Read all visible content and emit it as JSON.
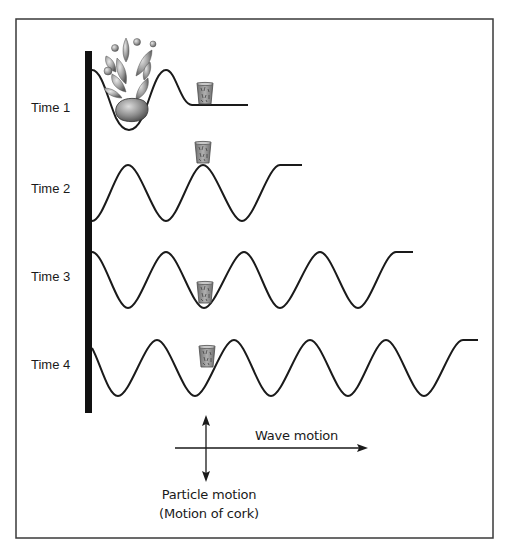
{
  "figure": {
    "frame": {
      "left": 16,
      "top": 19,
      "right": 493,
      "bottom": 538,
      "color": "#3a3a3a"
    },
    "barrier": {
      "x": 85,
      "width": 7,
      "top": 51,
      "bottom": 413,
      "color": "#111111"
    },
    "wave_color": "#1a1a1a",
    "cork_color": "#8a8a8a",
    "wavelength_px": 76,
    "amplitude_px": 28
  },
  "rows": [
    {
      "label": "Time 1",
      "label_y": 100,
      "cork_state": "at rest on flat water, splash from rock entering water",
      "cork": {
        "x": 197,
        "y": 82,
        "w": 16,
        "h": 22
      }
    },
    {
      "label": "Time 2",
      "label_y": 181,
      "cork_state": "on crest",
      "cork": {
        "x": 194,
        "y": 141,
        "w": 18,
        "h": 21
      }
    },
    {
      "label": "Time 3",
      "label_y": 269,
      "cork_state": "in trough",
      "cork": {
        "x": 196,
        "y": 281,
        "w": 18,
        "h": 22
      }
    },
    {
      "label": "Time 4",
      "label_y": 357,
      "cork_state": "mid-wave rising",
      "cork": {
        "x": 199,
        "y": 346,
        "w": 16,
        "h": 21
      }
    }
  ],
  "legend": {
    "wave_motion_label": "Wave motion",
    "particle_motion_label": "Particle motion",
    "particle_motion_sublabel": "(Motion of cork)"
  },
  "icons": {
    "cork": "cork-icon",
    "rock": "rock-icon",
    "splash": "splash-droplets-icon"
  }
}
